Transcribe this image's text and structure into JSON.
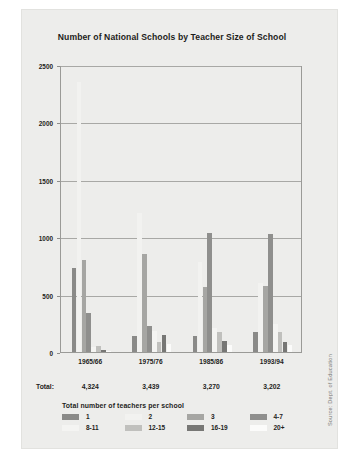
{
  "figure": {
    "title": "Number of National Schools by Teacher Size of School",
    "total_row_label": "Total:",
    "zero_tick": "0",
    "source_note": "Source: Dept. of Education"
  },
  "legend": {
    "title": "Total number of teachers per school",
    "items": [
      {
        "label": "1",
        "color": "#8a8a88"
      },
      {
        "label": "2",
        "color": "#f2f2f0"
      },
      {
        "label": "3",
        "color": "#a6a6a3"
      },
      {
        "label": "4-7",
        "color": "#8f8f8d"
      },
      {
        "label": "8-11",
        "color": "#f4f4f2"
      },
      {
        "label": "12-15",
        "color": "#c0c0bd"
      },
      {
        "label": "16-19",
        "color": "#777775"
      },
      {
        "label": "20+",
        "color": "#fbfbfa"
      }
    ]
  },
  "chart_data": {
    "type": "bar",
    "title": "Number of National Schools by Teacher Size of School",
    "xlabel": "",
    "ylabel": "",
    "ylim": [
      0,
      2500
    ],
    "yticks": [
      0,
      500,
      1000,
      1500,
      2000,
      2500
    ],
    "ytick_labels": [
      "0",
      "500",
      "1000",
      "1500",
      "2000",
      "2500"
    ],
    "grid": true,
    "legend_position": "below-plot",
    "categories": [
      "1965/66",
      "1975/76",
      "1985/86",
      "1993/94"
    ],
    "category_totals": [
      "4,324",
      "3,439",
      "3,270",
      "3,202"
    ],
    "series": [
      {
        "name": "1",
        "color": "#8a8a88",
        "values": [
          730,
          140,
          140,
          175
        ]
      },
      {
        "name": "2",
        "color": "#f2f2f0",
        "values": [
          2350,
          1210,
          780,
          600
        ]
      },
      {
        "name": "3",
        "color": "#a6a6a3",
        "values": [
          800,
          850,
          570,
          575
        ]
      },
      {
        "name": "4-7",
        "color": "#8f8f8d",
        "values": [
          340,
          230,
          1040,
          1030
        ]
      },
      {
        "name": "8-11",
        "color": "#f4f4f2",
        "values": [
          40,
          180,
          210,
          240
        ]
      },
      {
        "name": "12-15",
        "color": "#c0c0bd",
        "values": [
          55,
          90,
          170,
          170
        ]
      },
      {
        "name": "16-19",
        "color": "#777775",
        "values": [
          20,
          150,
          100,
          90
        ]
      },
      {
        "name": "20+",
        "color": "#fbfbfa",
        "values": [
          10,
          70,
          60,
          60
        ]
      }
    ]
  }
}
